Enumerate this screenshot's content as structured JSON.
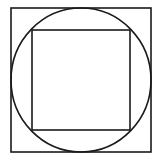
{
  "diagram": {
    "stroke_color": "#1a1a1a",
    "background": "#ffffff",
    "outer_square": {
      "x": 11,
      "y": 8,
      "width": 140,
      "height": 144
    },
    "circle": {
      "cx": 81,
      "cy": 80,
      "rx": 70,
      "ry": 72
    },
    "inner_square": {
      "x": 32,
      "y": 30,
      "width": 98,
      "height": 100
    }
  }
}
